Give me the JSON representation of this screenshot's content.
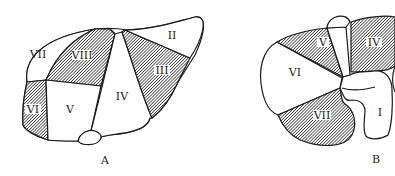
{
  "figure_a": {
    "caption": "A",
    "segments": {
      "II": "II",
      "III": "III",
      "IV": "IV",
      "V": "V",
      "VI": "VI",
      "VII": "VII",
      "VIII": "VIII"
    }
  },
  "figure_b": {
    "caption": "B",
    "segments": {
      "I": "I",
      "IV": "IV",
      "V": "V",
      "VI": "VI",
      "VII": "VII"
    }
  },
  "colors": {
    "line": "#1a1a1a",
    "hatch": "#3a3a3a",
    "background": "#ffffff"
  }
}
